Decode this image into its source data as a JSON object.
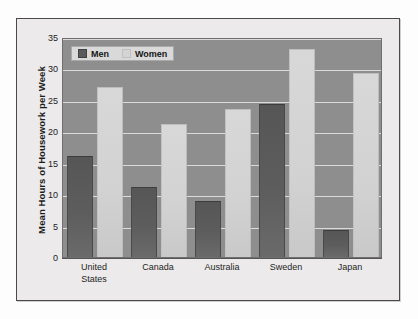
{
  "chart_data": {
    "type": "bar",
    "title": "",
    "xlabel": "",
    "ylabel": "Mean Hours of Housework per Week",
    "ylim": [
      0,
      35
    ],
    "yticks": [
      35,
      30,
      25,
      20,
      15,
      10,
      5,
      0
    ],
    "grid": true,
    "legend_position": "top-left-inside",
    "categories": [
      "United States",
      "Canada",
      "Australia",
      "Sweden",
      "Japan"
    ],
    "category_lines": [
      [
        "United",
        "States"
      ],
      [
        "Canada"
      ],
      [
        "Australia"
      ],
      [
        "Sweden"
      ],
      [
        "Japan"
      ]
    ],
    "series": [
      {
        "name": "Men",
        "color": "#5a5a5a",
        "values": [
          16.1,
          11.2,
          8.9,
          24.4,
          4.3
        ]
      },
      {
        "name": "Women",
        "color": "#d4d4d4",
        "values": [
          27.1,
          21.2,
          23.6,
          33.1,
          29.3
        ]
      }
    ]
  },
  "legend": {
    "entries": [
      {
        "label": "Men"
      },
      {
        "label": "Women"
      }
    ]
  },
  "colors": {
    "plot_background": "#8e8e8e",
    "page_background": "#eceaea",
    "gridline": "#e9e9e9",
    "frame_border": "#4a4a4a",
    "men_bar": "#5a5a5a",
    "women_bar": "#d4d4d4"
  }
}
